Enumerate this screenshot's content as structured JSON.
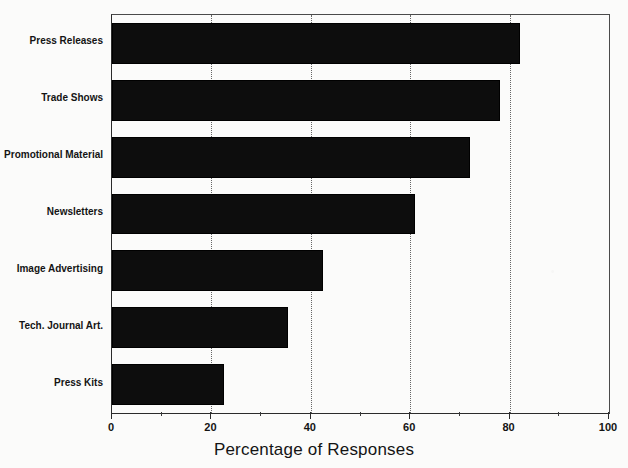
{
  "chart_data": {
    "type": "bar",
    "orientation": "horizontal",
    "title": "",
    "xlabel": "Percentage of Responses",
    "ylabel": "",
    "categories": [
      "Press Releases",
      "Trade Shows",
      "Promotional Material",
      "Newsletters",
      "Image Advertising",
      "Tech. Journal Art.",
      "Press Kits"
    ],
    "values": [
      82,
      78,
      72,
      61,
      42.5,
      35.5,
      22.5
    ],
    "xlim": [
      0,
      100
    ],
    "xticks": [
      0,
      20,
      40,
      60,
      80,
      100
    ],
    "xtick_labels": [
      "0",
      "20",
      "40",
      "60",
      "80",
      "100"
    ],
    "minor_xticks": [
      10,
      30,
      50,
      70,
      90
    ],
    "gridlines": [
      20,
      40,
      60,
      80
    ],
    "grid": true,
    "legend": null,
    "bar_color": "#0d0d0d",
    "axis_color": "#2b2b2b",
    "background_color": "#fbfbfa"
  },
  "axis": {
    "x_title": "Percentage of Responses"
  }
}
